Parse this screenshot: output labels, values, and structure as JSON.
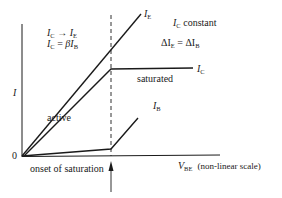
{
  "diagram": {
    "axes": {
      "y_label": "I",
      "origin_label": "0",
      "x_label_main": "V",
      "x_label_sub": "BE",
      "x_label_note": "(non-linear scale)"
    },
    "regions": {
      "active": "active",
      "saturated": "saturated"
    },
    "annotations": {
      "active_rule_1_lhs": "I",
      "active_rule_1_lhs_sub": "C",
      "active_rule_1_op": "→",
      "active_rule_1_rhs": "I",
      "active_rule_1_rhs_sub": "E",
      "active_rule_2_lhs": "I",
      "active_rule_2_lhs_sub": "C",
      "active_rule_2_op": "=",
      "active_rule_2_rhs": "βI",
      "active_rule_2_rhs_sub": "B",
      "sat_rule_1": "I",
      "sat_rule_1_sub": "C",
      "sat_rule_1_text": "constant",
      "sat_rule_2_lhs": "ΔI",
      "sat_rule_2_lhs_sub": "E",
      "sat_rule_2_op": "=",
      "sat_rule_2_rhs": "ΔI",
      "sat_rule_2_rhs_sub": "B",
      "onset": "onset of saturation"
    },
    "curves": [
      {
        "name": "I_E",
        "label": "I",
        "label_sub": "E"
      },
      {
        "name": "I_C",
        "label": "I",
        "label_sub": "C"
      },
      {
        "name": "I_B",
        "label": "I",
        "label_sub": "B"
      }
    ],
    "colors": {
      "ink": "#1a1a1a",
      "background": "#ffffff"
    }
  }
}
